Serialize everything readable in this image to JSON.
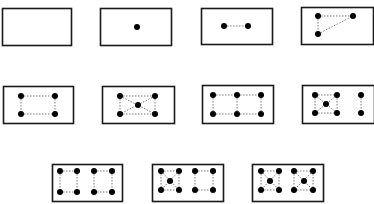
{
  "diagram": {
    "colors": {
      "background": "#ffffff",
      "stroke": "#1a1a1a",
      "dot": "#000000",
      "dash": "#555555"
    },
    "panels": [
      {
        "count": 0,
        "box": [
          2,
          8,
          69,
          37
        ],
        "dots": [],
        "lines": []
      },
      {
        "count": 1,
        "box": [
          100,
          8,
          71,
          37
        ],
        "dots": [
          [
            137,
            27
          ]
        ],
        "lines": []
      },
      {
        "count": 2,
        "box": [
          201,
          8,
          71,
          36
        ],
        "dots": [
          [
            224,
            26
          ],
          [
            248,
            26
          ]
        ],
        "lines": [
          [
            224,
            26,
            248,
            26
          ]
        ]
      },
      {
        "count": 3,
        "box": [
          301,
          7,
          72,
          37
        ],
        "dots": [
          [
            318,
            16
          ],
          [
            353,
            16
          ],
          [
            318,
            34
          ]
        ],
        "lines": [
          [
            318,
            16,
            353,
            16
          ],
          [
            318,
            16,
            318,
            34
          ],
          [
            318,
            34,
            353,
            16
          ]
        ]
      },
      {
        "count": 4,
        "box": [
          3,
          86,
          70,
          37
        ],
        "dots": [
          [
            21,
            96
          ],
          [
            55,
            96
          ],
          [
            21,
            114
          ],
          [
            55,
            114
          ]
        ],
        "lines": [
          [
            21,
            96,
            55,
            96
          ],
          [
            21,
            114,
            55,
            114
          ],
          [
            21,
            96,
            21,
            114
          ],
          [
            55,
            96,
            55,
            114
          ]
        ]
      },
      {
        "count": 5,
        "box": [
          102,
          86,
          72,
          37
        ],
        "dots": [
          [
            120,
            96
          ],
          [
            155,
            96
          ],
          [
            138,
            105
          ],
          [
            120,
            114
          ],
          [
            155,
            114
          ]
        ],
        "lines": [
          [
            120,
            96,
            155,
            96
          ],
          [
            120,
            114,
            155,
            114
          ],
          [
            120,
            96,
            120,
            114
          ],
          [
            155,
            96,
            155,
            114
          ],
          [
            120,
            96,
            155,
            114
          ],
          [
            155,
            96,
            120,
            114
          ]
        ]
      },
      {
        "count": 6,
        "box": [
          202,
          85,
          71,
          38
        ],
        "dots": [
          [
            213,
            95
          ],
          [
            237,
            95
          ],
          [
            261,
            95
          ],
          [
            213,
            114
          ],
          [
            237,
            114
          ],
          [
            261,
            114
          ]
        ],
        "lines": [
          [
            213,
            95,
            261,
            95
          ],
          [
            213,
            114,
            261,
            114
          ],
          [
            213,
            95,
            213,
            114
          ],
          [
            237,
            95,
            237,
            114
          ],
          [
            261,
            95,
            261,
            114
          ]
        ]
      },
      {
        "count": 7,
        "box": [
          302,
          85,
          72,
          38
        ],
        "dots": [
          [
            315,
            95
          ],
          [
            337,
            95
          ],
          [
            326,
            104
          ],
          [
            315,
            113
          ],
          [
            337,
            113
          ],
          [
            361,
            95
          ],
          [
            361,
            113
          ]
        ],
        "lines": [
          [
            315,
            95,
            337,
            95
          ],
          [
            315,
            113,
            337,
            113
          ],
          [
            315,
            95,
            315,
            113
          ],
          [
            337,
            95,
            337,
            113
          ],
          [
            315,
            95,
            337,
            113
          ],
          [
            337,
            95,
            315,
            113
          ],
          [
            361,
            95,
            361,
            113
          ]
        ]
      },
      {
        "count": 8,
        "box": [
          52,
          164,
          70,
          37
        ],
        "dots": [
          [
            60,
            171
          ],
          [
            77,
            171
          ],
          [
            94,
            171
          ],
          [
            112,
            171
          ],
          [
            60,
            192
          ],
          [
            77,
            192
          ],
          [
            94,
            192
          ],
          [
            112,
            192
          ]
        ],
        "lines": [
          [
            60,
            171,
            77,
            171
          ],
          [
            60,
            192,
            77,
            192
          ],
          [
            60,
            171,
            60,
            192
          ],
          [
            77,
            171,
            77,
            192
          ],
          [
            94,
            171,
            112,
            171
          ],
          [
            94,
            192,
            112,
            192
          ],
          [
            94,
            171,
            94,
            192
          ],
          [
            112,
            171,
            112,
            192
          ]
        ]
      },
      {
        "count": 9,
        "box": [
          152,
          164,
          71,
          37
        ],
        "dots": [
          [
            161,
            171
          ],
          [
            179,
            171
          ],
          [
            170,
            181
          ],
          [
            161,
            190
          ],
          [
            179,
            190
          ],
          [
            195,
            171
          ],
          [
            213,
            171
          ],
          [
            195,
            190
          ],
          [
            213,
            190
          ]
        ],
        "lines": [
          [
            161,
            171,
            179,
            171
          ],
          [
            161,
            190,
            179,
            190
          ],
          [
            161,
            171,
            161,
            190
          ],
          [
            179,
            171,
            179,
            190
          ],
          [
            161,
            171,
            179,
            190
          ],
          [
            179,
            171,
            161,
            190
          ],
          [
            195,
            171,
            213,
            171
          ],
          [
            195,
            190,
            213,
            190
          ],
          [
            195,
            171,
            195,
            190
          ],
          [
            213,
            171,
            213,
            190
          ]
        ]
      },
      {
        "count": 10,
        "box": [
          252,
          164,
          71,
          37
        ],
        "dots": [
          [
            261,
            171
          ],
          [
            279,
            171
          ],
          [
            270,
            181
          ],
          [
            261,
            190
          ],
          [
            279,
            190
          ],
          [
            294,
            171
          ],
          [
            313,
            171
          ],
          [
            304,
            181
          ],
          [
            294,
            190
          ],
          [
            313,
            190
          ]
        ],
        "lines": [
          [
            261,
            171,
            279,
            171
          ],
          [
            261,
            190,
            279,
            190
          ],
          [
            261,
            171,
            261,
            190
          ],
          [
            279,
            171,
            279,
            190
          ],
          [
            261,
            171,
            279,
            190
          ],
          [
            279,
            171,
            261,
            190
          ],
          [
            294,
            171,
            313,
            171
          ],
          [
            294,
            190,
            313,
            190
          ],
          [
            294,
            171,
            294,
            190
          ],
          [
            313,
            171,
            313,
            190
          ],
          [
            294,
            171,
            313,
            190
          ],
          [
            313,
            171,
            294,
            190
          ]
        ]
      }
    ]
  }
}
